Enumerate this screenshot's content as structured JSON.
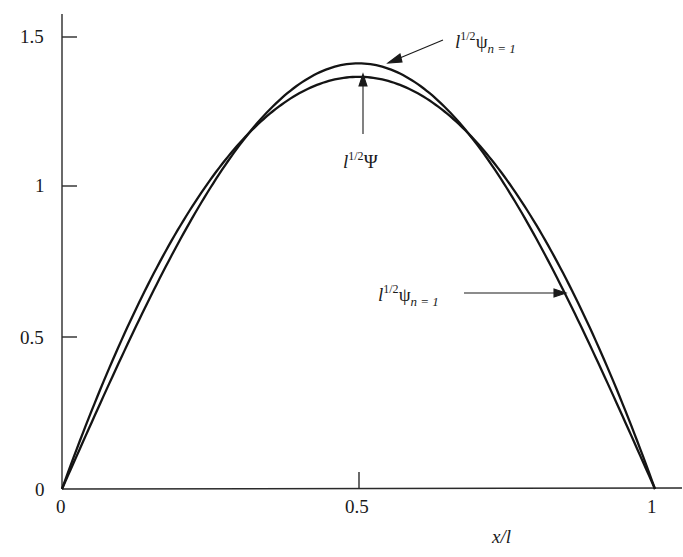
{
  "chart_data": {
    "type": "line",
    "title": "",
    "xlabel": "x/l",
    "ylabel": "",
    "xlim": [
      0,
      1
    ],
    "ylim": [
      0,
      1.5
    ],
    "grid": false,
    "legend": "none (curves labeled with arrow annotations)",
    "x_ticks": [
      "0",
      "0.5",
      "1"
    ],
    "y_ticks": [
      "0",
      "0.5",
      "1",
      "1.5"
    ],
    "x": [
      0,
      0.05,
      0.1,
      0.15,
      0.2,
      0.25,
      0.3,
      0.35,
      0.4,
      0.45,
      0.5,
      0.55,
      0.6,
      0.65,
      0.7,
      0.75,
      0.8,
      0.85,
      0.9,
      0.95,
      1.0
    ],
    "series": [
      {
        "name": "l^{1/2} ψ_{n=1}",
        "formula": "sqrt(2)·sin(π x/l)",
        "values": [
          0,
          0.221,
          0.437,
          0.642,
          0.831,
          1.0,
          1.144,
          1.26,
          1.345,
          1.397,
          1.414,
          1.397,
          1.345,
          1.26,
          1.144,
          1.0,
          0.831,
          0.642,
          0.437,
          0.221,
          0
        ]
      },
      {
        "name": "l^{1/2} Ψ",
        "formula": "sqrt(30)·(x/l)(1 − x/l)",
        "values": [
          0,
          0.26,
          0.493,
          0.698,
          0.876,
          1.027,
          1.15,
          1.246,
          1.315,
          1.356,
          1.369,
          1.356,
          1.315,
          1.246,
          1.15,
          1.027,
          0.876,
          0.698,
          0.493,
          0.26,
          0
        ]
      }
    ],
    "annotations": [
      {
        "text": "l^{1/2}ψ_{n=1}",
        "target": "ψ curve near peak",
        "position": "top-right"
      },
      {
        "text": "l^{1/2}Ψ",
        "target": "Ψ curve at peak",
        "position": "below peak"
      },
      {
        "text": "l^{1/2}ψ_{n=1}",
        "target": "ψ curve on right flank",
        "position": "right side"
      }
    ]
  },
  "labels": {
    "y_tick_0": "0",
    "y_tick_05": "0.5",
    "y_tick_1": "1",
    "y_tick_15": "1.5",
    "x_tick_0": "0",
    "x_tick_05": "0.5",
    "x_tick_1": "1",
    "x_axis_label": "x/l",
    "ann_base": "l",
    "ann_power": "1/2",
    "ann_psi_lower": "ψ",
    "ann_psi_upper": "Ψ",
    "ann_sub": "n = 1"
  },
  "style": {
    "line_color": "#141414",
    "axis_color": "#2a2a2a"
  }
}
